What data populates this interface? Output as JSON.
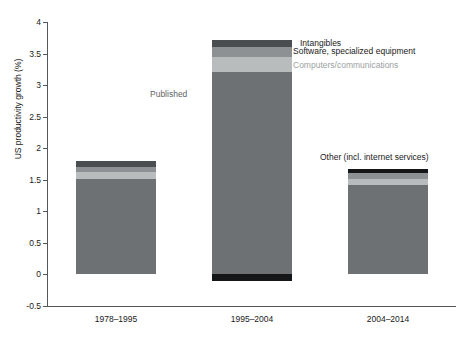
{
  "chart_data": {
    "type": "bar",
    "subtype": "stacked-bar",
    "title": "",
    "xlabel": "",
    "ylabel": "US productivity growth (%)",
    "categories": [
      "1978–1995",
      "1995–2004",
      "2004–2014"
    ],
    "ylim": [
      -0.5,
      4
    ],
    "yticks": [
      -0.5,
      0,
      0.5,
      1,
      1.5,
      2,
      2.5,
      3,
      3.5,
      4
    ],
    "ytick_labels": [
      "-0.5",
      "0",
      "0.5",
      "1",
      "1.5",
      "2",
      "2.5",
      "3",
      "3.5",
      "4"
    ],
    "grid": false,
    "legend_position": "annotated-callouts",
    "series": [
      {
        "name": "Published",
        "color": "#6e7173",
        "values": [
          1.52,
          3.21,
          1.41
        ]
      },
      {
        "name": "Computers/communications",
        "color": "#b9bcbd",
        "values": [
          0.11,
          0.23,
          0.11
        ]
      },
      {
        "name": "Software, specialized equipment",
        "color": "#8e9193",
        "values": [
          0.07,
          0.16,
          0.08
        ]
      },
      {
        "name": "Intangibles",
        "color": "#4a4d4f",
        "values": [
          0.1,
          0.11,
          0.0
        ]
      },
      {
        "name": "Other (incl. internet services)",
        "color": "#151617",
        "values": [
          0.0,
          -0.11,
          0.07
        ]
      }
    ],
    "totals": [
      1.8,
      3.71,
      1.67
    ],
    "annotations": [
      {
        "text": "Intangibles",
        "target_series": "Intangibles",
        "color": "#1a1a1a"
      },
      {
        "text": "Software, specialized equipment",
        "target_series": "Software, specialized equipment",
        "color": "#1a1a1a"
      },
      {
        "text": "Computers/communications",
        "target_series": "Computers/communications",
        "color": "#9b9fa1"
      },
      {
        "text": "Published",
        "target_series": "Published",
        "color": "#5f6365"
      },
      {
        "text": "Other (incl. internet services)",
        "target_series": "Other (incl. internet services)",
        "color": "#1a1a1a"
      }
    ]
  },
  "labels": {
    "annot_intangibles": "Intangibles",
    "annot_software": "Software, specialized equipment",
    "annot_computers": "Computers/communications",
    "annot_published": "Published",
    "annot_other": "Other (incl. internet services)"
  }
}
